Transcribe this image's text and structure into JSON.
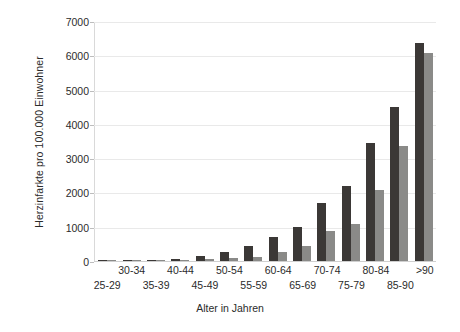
{
  "chart_data": {
    "type": "bar",
    "title": "",
    "xlabel": "Alter in Jahren",
    "ylabel": "Herzinfarkte pro 100.000 Einwohner",
    "categories": [
      "25-29",
      "30-34",
      "35-39",
      "40-44",
      "45-49",
      "50-54",
      "55-59",
      "60-64",
      "65-69",
      "70-74",
      "75-79",
      "80-84",
      "85-90",
      ">90"
    ],
    "series": [
      {
        "name": "dunkel",
        "color": "#3b3836",
        "values": [
          10,
          15,
          25,
          70,
          160,
          260,
          450,
          710,
          1000,
          1680,
          2180,
          3450,
          4480,
          6350
        ]
      },
      {
        "name": "hell",
        "color": "#8a8a88",
        "values": [
          5,
          8,
          12,
          20,
          45,
          80,
          130,
          265,
          440,
          870,
          1080,
          2065,
          3360,
          6080
        ]
      }
    ],
    "ylim": [
      0,
      7000
    ],
    "yticks": [
      0,
      1000,
      2000,
      3000,
      4000,
      5000,
      6000,
      7000
    ],
    "ytick_labels": [
      "0",
      "1000",
      "2000",
      "3000",
      "4000",
      "5000",
      "6000",
      "7000"
    ],
    "grid": true,
    "legend": "none",
    "colors": {
      "series_dark": "#3b3836",
      "series_light": "#8a8a88",
      "gridline": "#e9e9e9",
      "axis": "#cfcfcf",
      "text": "#2b2b2b",
      "background": "#ffffff"
    }
  }
}
